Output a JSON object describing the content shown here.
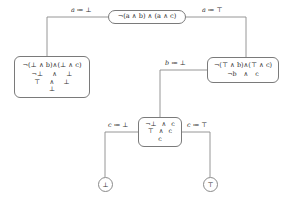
{
  "diagram": {
    "type": "shannon-expansion-decision-tree",
    "nodes": {
      "root": {
        "id": "root",
        "lines": [
          "¬(a ∧ b) ∧ (a ∧ c)"
        ]
      },
      "left": {
        "id": "a-false",
        "lines": [
          "¬(⊥ ∧ b)∧(⊥ ∧ c)",
          "¬⊥",
          "∧",
          "⊥",
          "⊤",
          "∧",
          "⊥",
          "⊥"
        ]
      },
      "right": {
        "id": "a-true",
        "lines": [
          "¬(⊤ ∧ b)∧(⊤ ∧ c)",
          "¬b",
          "∧",
          "c"
        ]
      },
      "mid": {
        "id": "b-false",
        "lines": [
          "¬⊥",
          "∧",
          "c",
          "⊤",
          "∧",
          "c",
          "c"
        ]
      },
      "terminal_bottom": {
        "id": "result-false",
        "label": "⊥"
      },
      "terminal_top": {
        "id": "result-true",
        "label": "⊤"
      }
    },
    "edge_labels": {
      "a_false": {
        "var": "a",
        "op": " ≔ ",
        "value": "⊥"
      },
      "a_true": {
        "var": "a",
        "op": " ≔ ",
        "value": "⊤"
      },
      "b_false": {
        "var": "b",
        "op": " ≔ ",
        "value": "⊥"
      },
      "c_false": {
        "var": "c",
        "op": " ≔ ",
        "value": "⊥"
      },
      "c_true": {
        "var": "c",
        "op": " ≔ ",
        "value": "⊤"
      }
    },
    "colors": {
      "stroke": "#7a7a7a",
      "text": "#303030",
      "background": "#ffffff"
    }
  }
}
